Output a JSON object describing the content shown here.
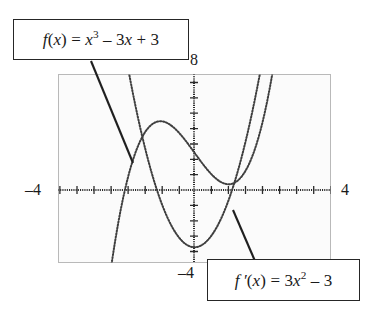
{
  "figure": {
    "name": "graphing-calculator-screen",
    "background_color": "#ffffff",
    "screen_fill": "#fbfbfb",
    "screen_border_color": "#b9b9b9",
    "ink_color": "#262626"
  },
  "callouts": [
    {
      "id": "fx",
      "text": "f(x) = x3 − 3x + 3",
      "lhs": "f",
      "lhs_arg": "(x)",
      "eq": "=",
      "base": "x",
      "exponent": "3",
      "term2": "− 3x + 3",
      "leader_from": [
        91,
        61
      ],
      "leader_to": [
        133,
        163
      ]
    },
    {
      "id": "fprimex",
      "text": "f′(x) = 3x2 − 3",
      "lhs": "f′",
      "lhs_arg": "(x)",
      "eq": "=",
      "coef": "3",
      "base": "x",
      "exponent": "2",
      "term2": "− 3",
      "leader_from": [
        255,
        261
      ],
      "leader_to": [
        233,
        210
      ]
    }
  ],
  "axis_labels": {
    "top": "8",
    "left": "–4",
    "right": "4",
    "bottom": "–4"
  },
  "chart_data": {
    "type": "line",
    "title": "",
    "xlabel": "",
    "ylabel": "",
    "xlim": [
      -4,
      4
    ],
    "ylim": [
      -4,
      8
    ],
    "xtick_step": 0.5,
    "ytick_step": 0.5,
    "grid": false,
    "legend": "annotation-callouts",
    "style": "dotted-pixel-trace",
    "series": [
      {
        "name": "f(x) = x^3 - 3x + 3",
        "expression": "x**3 - 3*x + 3",
        "local_max": {
          "x": -1,
          "y": 5
        },
        "local_min": {
          "x": 1,
          "y": 1
        },
        "x": [
          -4,
          -3.5,
          -3,
          -2.5,
          -2.3,
          -2.1,
          -2,
          -1.8,
          -1.6,
          -1.4,
          -1.2,
          -1,
          -0.8,
          -0.6,
          -0.4,
          -0.2,
          0,
          0.2,
          0.4,
          0.6,
          0.8,
          1,
          1.2,
          1.4,
          1.6,
          1.8,
          2,
          2.2,
          2.4,
          2.6,
          2.8,
          3,
          3.2
        ],
        "y": [
          -49,
          -29.4,
          -15,
          -6.1,
          -2.27,
          0.04,
          1,
          2.57,
          3.7,
          4.46,
          4.87,
          5,
          4.89,
          4.58,
          4.14,
          3.59,
          3,
          2.41,
          1.86,
          1.42,
          1.11,
          1,
          1.13,
          1.54,
          2.3,
          3.43,
          5,
          7.05,
          9.62,
          12.78,
          16.55,
          21,
          26.17
        ]
      },
      {
        "name": "f'(x) = 3x^2 - 3",
        "expression": "3*x**2 - 3",
        "roots": [
          -1,
          1
        ],
        "vertex": {
          "x": 0,
          "y": -3
        },
        "x": [
          -2.2,
          -2,
          -1.8,
          -1.6,
          -1.4,
          -1.2,
          -1,
          -0.8,
          -0.6,
          -0.4,
          -0.2,
          0,
          0.2,
          0.4,
          0.6,
          0.8,
          1,
          1.2,
          1.4,
          1.6,
          1.8,
          2,
          2.2
        ],
        "y": [
          11.52,
          9,
          6.72,
          4.68,
          2.88,
          1.32,
          0,
          -1.08,
          -1.92,
          -2.52,
          -2.88,
          -3,
          -2.88,
          -2.52,
          -1.92,
          -1.08,
          0,
          1.32,
          2.88,
          4.68,
          6.72,
          9,
          11.52
        ]
      }
    ]
  }
}
